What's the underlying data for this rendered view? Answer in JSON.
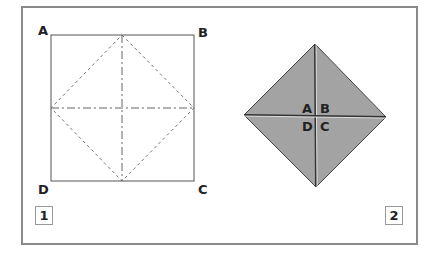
{
  "figure1": {
    "badge": "1",
    "corners": {
      "top_left": "A",
      "top_right": "B",
      "bottom_left": "D",
      "bottom_right": "C"
    }
  },
  "figure2": {
    "badge": "2",
    "labels": {
      "top_left": "A",
      "top_right": "B",
      "bottom_left": "D",
      "bottom_right": "C"
    },
    "fill_color": "#a3a3a3"
  },
  "colors": {
    "frame": "#8a8a8a",
    "line": "#555555"
  }
}
